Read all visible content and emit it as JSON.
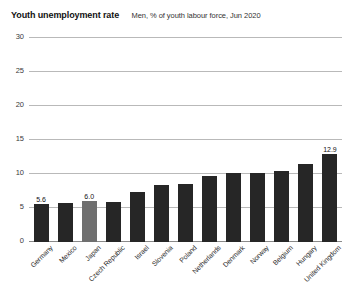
{
  "header": {
    "title": "Youth unemployment rate",
    "subtitle": "Men, % of youth labour force, Jun 2020"
  },
  "chart_data": {
    "type": "bar",
    "title": "Youth unemployment rate",
    "subtitle": "Men, % of youth labour force, Jun 2020",
    "xlabel": "",
    "ylabel": "",
    "ylim": [
      0,
      30
    ],
    "yticks": [
      0,
      5,
      10,
      15,
      20,
      25,
      30
    ],
    "grid": true,
    "legend": false,
    "categories": [
      "Germany",
      "Mexico",
      "Japan",
      "Czech Republic",
      "Israel",
      "Slovenia",
      "Poland",
      "Netherlands",
      "Denmark",
      "Norway",
      "Belgium",
      "Hungary",
      "United Kingdom"
    ],
    "values": [
      5.6,
      5.7,
      6.0,
      5.9,
      7.3,
      8.4,
      8.6,
      9.7,
      10.2,
      10.2,
      10.5,
      11.5,
      12.9
    ],
    "labeled_points": [
      {
        "category": "Germany",
        "label": "5.6"
      },
      {
        "category": "Japan",
        "label": "6.0"
      },
      {
        "category": "United Kingdom",
        "label": "12.9"
      }
    ],
    "highlight_category": "Japan",
    "colors": {
      "bar": "#262626",
      "bar_highlight": "#6f6f6f",
      "grid": "#b9b9b9",
      "baseline": "#8a8a8a",
      "background": "#ffffff",
      "text": "#1a1a1a"
    }
  }
}
